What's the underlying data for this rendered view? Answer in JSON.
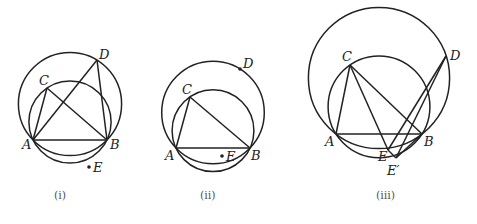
{
  "figures": [
    {
      "caption": "(ⅰ)",
      "points": {
        "A": "A",
        "B": "B",
        "C": "C",
        "D": "D",
        "E": "E"
      }
    },
    {
      "caption": "(ⅱ)",
      "points": {
        "A": "A",
        "B": "B",
        "C": "C",
        "D": "D",
        "E": "E"
      }
    },
    {
      "caption": "(ⅲ)",
      "points": {
        "A": "A",
        "B": "B",
        "C": "C",
        "D": "D",
        "E": "E",
        "E2": "E′"
      }
    }
  ]
}
